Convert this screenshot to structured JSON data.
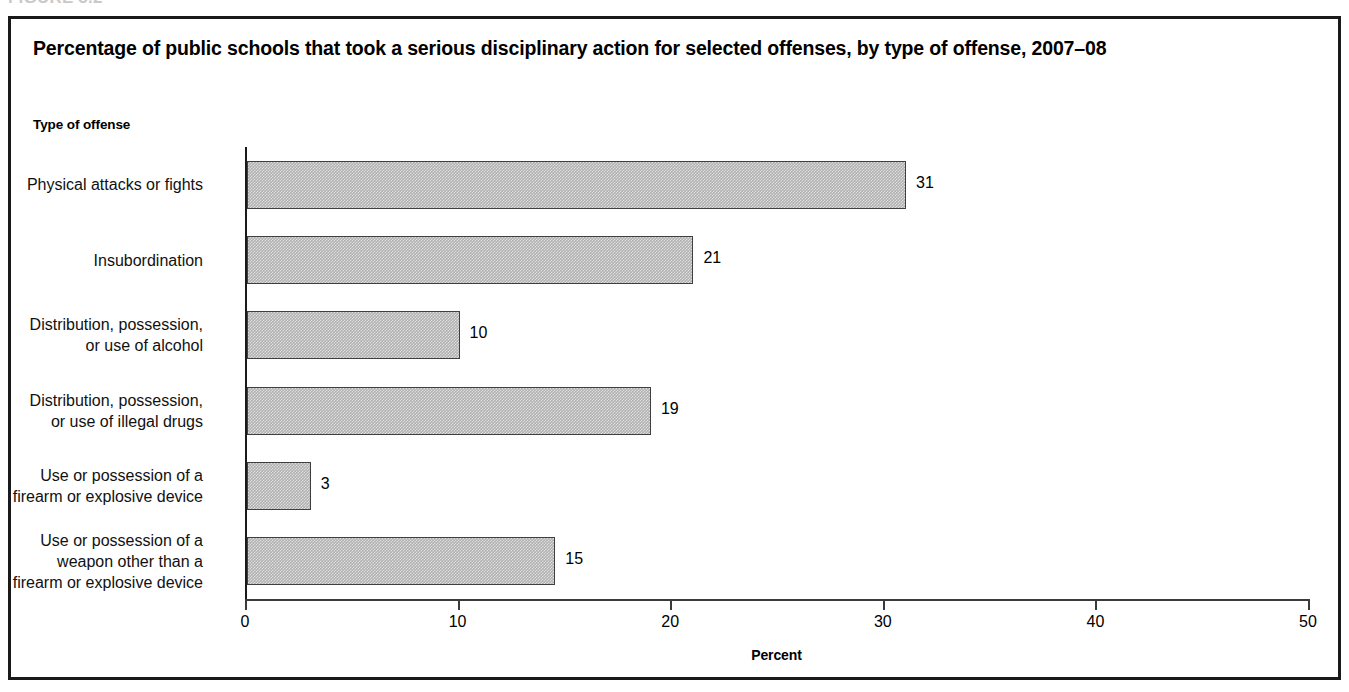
{
  "figure": {
    "caption_clipped": "FIGURE 5.2"
  },
  "chart_data": {
    "type": "bar",
    "orientation": "horizontal",
    "title": "Percentage of public schools that took a serious disciplinary action for selected offenses, by type of offense, 2007–08",
    "xlabel": "Percent",
    "ylabel": "Type of offense",
    "xlim": [
      0,
      50
    ],
    "xticks": [
      "0",
      "10",
      "20",
      "30",
      "40",
      "50"
    ],
    "xtick_values": [
      0,
      10,
      20,
      30,
      40,
      50
    ],
    "grid": false,
    "legend": null,
    "bar_color": "#b0b0b0",
    "bar_border_color": "#3f3f3f",
    "categories": [
      "Physical attacks or fights",
      "Insubordination",
      "Distribution, possession,\nor use of alcohol",
      "Distribution, possession,\nor use of illegal drugs",
      "Use or possession of a\nfirearm or explosive device",
      "Use or possession of a\nweapon other than a\nfirearm or explosive device"
    ],
    "values": [
      31,
      21,
      10,
      19,
      3,
      15
    ],
    "value_labels": [
      "31",
      "21",
      "10",
      "19",
      "3",
      "15"
    ],
    "bars": [
      {
        "label_lines": [
          "Physical attacks or fights"
        ],
        "value": 31,
        "value_label": "31"
      },
      {
        "label_lines": [
          "Insubordination"
        ],
        "value": 21,
        "value_label": "21"
      },
      {
        "label_lines": [
          "Distribution, possession,",
          "or use of alcohol"
        ],
        "value": 10,
        "value_label": "10"
      },
      {
        "label_lines": [
          "Distribution, possession,",
          "or use of illegal drugs"
        ],
        "value": 19,
        "value_label": "19"
      },
      {
        "label_lines": [
          "Use or possession of a",
          "firearm or explosive device"
        ],
        "value": 3,
        "value_label": "3"
      },
      {
        "label_lines": [
          "Use or possession of a",
          "weapon other than a",
          "firearm or explosive device"
        ],
        "value": 14.5,
        "value_label": "15"
      }
    ]
  }
}
